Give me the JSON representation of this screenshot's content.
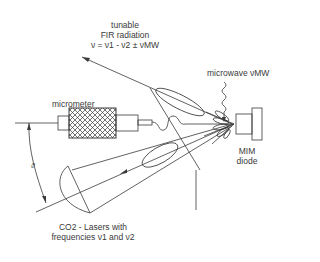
{
  "diagram": {
    "labels": {
      "fir_line1": "tunable",
      "fir_line2": "FIR radiation",
      "fir_formula": "ν = ν1 - ν2 ± νMW",
      "micrometer": "micrometer",
      "microwave": "microwave νMW",
      "mim_line1": "MIM",
      "mim_line2": "diode",
      "lasers_line1": "CO2 - Lasers with",
      "lasers_line2": "frequencies ν1 and ν2",
      "angle": "ϑ"
    },
    "components": [
      "micrometer",
      "MIM diode",
      "microwave feed",
      "CO2 laser mirror",
      "FIR output beam",
      "laser input beam"
    ],
    "colors": {
      "line": "#3a3a3a",
      "background": "#ffffff"
    }
  }
}
